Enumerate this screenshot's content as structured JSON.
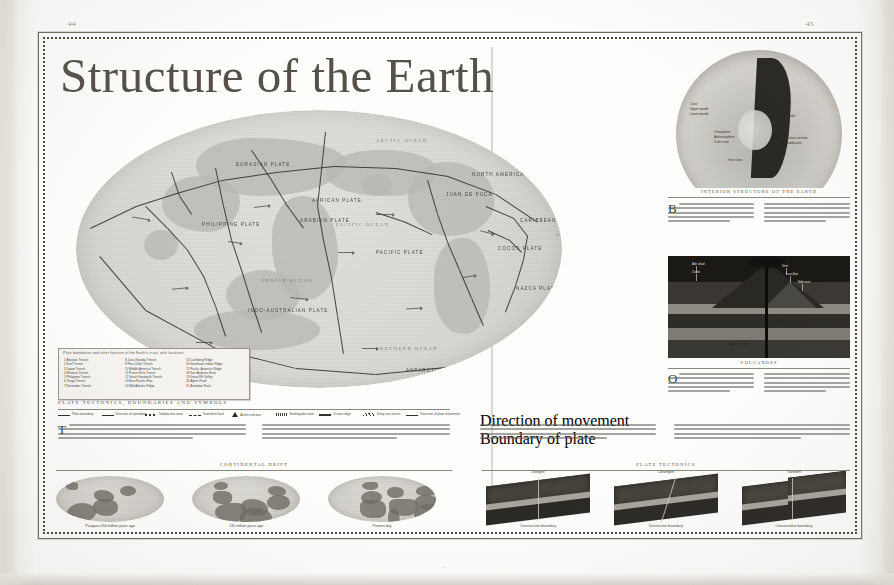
{
  "document": {
    "title": "Structure of the Earth",
    "folio_left": "44",
    "folio_right": "45",
    "bottom_mark": "·"
  },
  "map": {
    "plate_labels": [
      {
        "text": "EURASIAN PLATE",
        "x": 160,
        "y": 52
      },
      {
        "text": "NORTH AMERICAN PLATE",
        "x": 396,
        "y": 62
      },
      {
        "text": "PACIFIC PLATE",
        "x": 300,
        "y": 140
      },
      {
        "text": "SOUTH AMERICAN PLATE",
        "x": 516,
        "y": 164
      },
      {
        "text": "AFRICAN PLATE",
        "x": 236,
        "y": 88
      },
      {
        "text": "INDO-AUSTRALIAN PLATE",
        "x": 172,
        "y": 198
      },
      {
        "text": "ANTARCTIC PLATE",
        "x": 330,
        "y": 258
      },
      {
        "text": "NAZCA PLATE",
        "x": 440,
        "y": 176
      },
      {
        "text": "COCOS PLATE",
        "x": 422,
        "y": 136
      },
      {
        "text": "ARABIAN PLATE",
        "x": 224,
        "y": 108
      },
      {
        "text": "PHILIPPINE PLATE",
        "x": 126,
        "y": 112
      },
      {
        "text": "CARIBBEAN PLATE",
        "x": 444,
        "y": 108
      },
      {
        "text": "SCOTIA PLATE",
        "x": 478,
        "y": 238
      },
      {
        "text": "JUAN DE FUCA",
        "x": 370,
        "y": 82
      }
    ],
    "ocean_labels": [
      {
        "text": "PACIFIC OCEAN",
        "x": 260,
        "y": 112
      },
      {
        "text": "ATLANTIC OCEAN",
        "x": 480,
        "y": 122
      },
      {
        "text": "INDIAN OCEAN",
        "x": 186,
        "y": 168
      },
      {
        "text": "SOUTHERN OCEAN",
        "x": 300,
        "y": 236
      },
      {
        "text": "ARCTIC OCEAN",
        "x": 300,
        "y": 28
      }
    ],
    "key": {
      "heading": "Plate boundaries and other features of the Earth's crust, with locations",
      "columns": [
        [
          "1  Aleutian Trench",
          "2  Kuril Trench",
          "3  Japan Trench",
          "4  Mariana Trench",
          "5  Philippine Trench",
          "6  Tonga Trench",
          "7  Kermadec Trench"
        ],
        [
          "8  Java (Sunda) Trench",
          "9  Peru-Chile Trench",
          "10  Middle America Trench",
          "11  Puerto Rico Trench",
          "12  South Sandwich Trench",
          "13  East Pacific Rise",
          "14  Mid-Atlantic Ridge"
        ],
        [
          "15  Carlsberg Ridge",
          "16  Southeast Indian Ridge",
          "17  Pacific-Antarctic Ridge",
          "18  San Andreas Fault",
          "19  Great Rift Valley",
          "20  Alpine Fault",
          "21  Anatolian Fault"
        ]
      ]
    },
    "symbol_legend": {
      "heading": "PLATE TECTONICS, BOUNDARIES AND SYMBOLS",
      "items": [
        {
          "label": "Plate boundary",
          "glyph": "solid-line"
        },
        {
          "label": "Direction of spreading",
          "glyph": "arrow-line"
        },
        {
          "label": "Subduction zone",
          "glyph": "toothed-line"
        },
        {
          "label": "Transform fault",
          "glyph": "dashed-line"
        },
        {
          "label": "Active volcano",
          "glyph": "triangle"
        },
        {
          "label": "Earthquake zone",
          "glyph": "dotted-band"
        },
        {
          "label": "Ocean ridge",
          "glyph": "thick-line"
        },
        {
          "label": "Deep sea trench",
          "glyph": "hatched-line"
        },
        {
          "label": "Direction of plate movement",
          "glyph": "long-arrow"
        }
      ]
    }
  },
  "left_text": {
    "dropcap": "T",
    "col1_lines": 4,
    "col2_lines": 4
  },
  "globes": {
    "heading": "CONTINENTAL DRIFT",
    "items": [
      {
        "caption": "Pangaea 250 million years ago"
      },
      {
        "caption": "135 million years ago"
      },
      {
        "caption": "Present day"
      }
    ]
  },
  "right_page": {
    "cutaway": {
      "caption": "INTERIOR STRUCTURE OF THE EARTH",
      "labels": [
        {
          "text": "Crust",
          "x": 22,
          "y": 56
        },
        {
          "text": "Upper mantle",
          "x": 22,
          "y": 61
        },
        {
          "text": "Lower mantle",
          "x": 22,
          "y": 66
        },
        {
          "text": "Lithosphere",
          "x": 46,
          "y": 84
        },
        {
          "text": "Asthenosphere",
          "x": 46,
          "y": 89
        },
        {
          "text": "Outer core",
          "x": 46,
          "y": 94
        },
        {
          "text": "Inner core",
          "x": 60,
          "y": 112
        },
        {
          "text": "Mantle",
          "x": 118,
          "y": 68
        },
        {
          "text": "Convection currents",
          "x": 112,
          "y": 90
        },
        {
          "text": "Subduction",
          "x": 118,
          "y": 95
        }
      ],
      "dropcap": "B"
    },
    "volcano": {
      "caption": "VOLCANOES",
      "labels": [
        {
          "text": "Ash cloud",
          "x": 24,
          "y": 6,
          "dark": false
        },
        {
          "text": "Crater",
          "x": 24,
          "y": 14,
          "dark": false
        },
        {
          "text": "Vent",
          "x": 114,
          "y": 8,
          "dark": false
        },
        {
          "text": "Lava flow",
          "x": 118,
          "y": 16,
          "dark": false
        },
        {
          "text": "Side vent",
          "x": 130,
          "y": 24,
          "dark": false
        },
        {
          "text": "Magma chamber",
          "x": 60,
          "y": 86,
          "dark": true
        },
        {
          "text": "Conduit",
          "x": 106,
          "y": 62,
          "dark": true
        }
      ],
      "dropcap": "O"
    },
    "symbol_legend_2": [
      {
        "label": "Direction of movement",
        "glyph": "arrow-line"
      },
      {
        "label": "Boundary of plate",
        "glyph": "solid-line"
      }
    ],
    "body_col1_lines": 4,
    "body_col2_lines": 4
  },
  "blocks": {
    "heading": "PLATE TECTONICS",
    "items": [
      {
        "title": "Divergent",
        "caption": "Constructive boundary"
      },
      {
        "title": "Convergent",
        "caption": "Destructive boundary"
      },
      {
        "title": "Transform",
        "caption": "Conservative boundary"
      }
    ]
  },
  "colors": {
    "page": "#fdfdfb",
    "ink": "#3a3833",
    "title": "#555049",
    "frame": "#6e6a62",
    "map_land": "#b9b8b2",
    "map_sea": "#d9d8d3",
    "volcano_dark": "#131210"
  }
}
